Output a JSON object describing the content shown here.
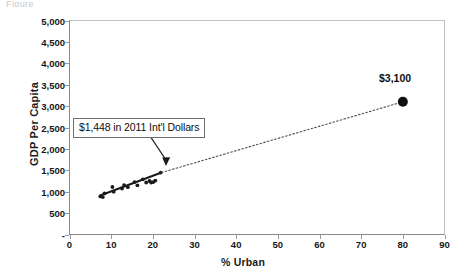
{
  "figure": {
    "top_caption_fragment": "Figure",
    "x_axis_title": "% Urban",
    "y_axis_title": "GDP Per Capita"
  },
  "annotations": {
    "callout_text": "$1,448 in 2011 Int'l Dollars",
    "highlight_point_label": "$3,100"
  },
  "chart_data": {
    "type": "scatter",
    "title": "",
    "subtitle": "",
    "xlabel": "% Urban",
    "ylabel": "GDP Per Capita",
    "xlim": [
      0,
      90
    ],
    "ylim": [
      0,
      5000
    ],
    "xticks": [
      0,
      10,
      20,
      30,
      40,
      50,
      60,
      70,
      80,
      90
    ],
    "xticklabels": [
      "0",
      "10",
      "20",
      "30",
      "40",
      "50",
      "60",
      "70",
      "80",
      "90"
    ],
    "yticks": [
      0,
      500,
      1000,
      1500,
      2000,
      2500,
      3000,
      3500,
      4000,
      4500,
      5000
    ],
    "yticklabels": [
      "-",
      "500",
      "1,000",
      "1,500",
      "2,000",
      "2,500",
      "3,000",
      "3,500",
      "4,000",
      "4,500",
      "5,000"
    ],
    "grid": false,
    "legend": false,
    "legend_position": "none",
    "series": [
      {
        "name": "Observed countries",
        "type": "scatter",
        "marker": "filled-circle",
        "color": "#1a1a1a",
        "points": [
          {
            "x": 7.4,
            "y": 890
          },
          {
            "x": 8.0,
            "y": 875
          },
          {
            "x": 8.4,
            "y": 960
          },
          {
            "x": 10.3,
            "y": 1110
          },
          {
            "x": 10.6,
            "y": 1000
          },
          {
            "x": 12.6,
            "y": 1075
          },
          {
            "x": 13.1,
            "y": 1155
          },
          {
            "x": 14.0,
            "y": 1105
          },
          {
            "x": 15.6,
            "y": 1225
          },
          {
            "x": 16.3,
            "y": 1150
          },
          {
            "x": 17.6,
            "y": 1290
          },
          {
            "x": 18.4,
            "y": 1215
          },
          {
            "x": 19.2,
            "y": 1250
          },
          {
            "x": 19.6,
            "y": 1215
          },
          {
            "x": 20.1,
            "y": 1225
          },
          {
            "x": 20.6,
            "y": 1260
          },
          {
            "x": 21.9,
            "y": 1448
          }
        ]
      },
      {
        "name": "Fitted trend (observed range)",
        "type": "line",
        "style": "solid",
        "color": "#1a1a1a",
        "points": [
          {
            "x": 7.2,
            "y": 905
          },
          {
            "x": 22.1,
            "y": 1448
          }
        ]
      },
      {
        "name": "Extrapolated trend",
        "type": "line",
        "style": "dotted",
        "color": "#4d4d4d",
        "points": [
          {
            "x": 22.1,
            "y": 1448
          },
          {
            "x": 80.0,
            "y": 3100
          }
        ]
      },
      {
        "name": "Projection at 80% urban",
        "type": "scatter",
        "marker": "large-filled-circle",
        "color": "#111111",
        "points": [
          {
            "x": 80.0,
            "y": 3100,
            "label": "$3,100"
          }
        ]
      }
    ],
    "annotations": [
      {
        "text": "$1,448 in 2011 Int'l Dollars",
        "type": "box-with-arrow",
        "points_to": {
          "x": 21.9,
          "y": 1448
        }
      },
      {
        "text": "$3,100",
        "type": "point-label",
        "points_to": {
          "x": 80.0,
          "y": 3100
        }
      }
    ]
  }
}
